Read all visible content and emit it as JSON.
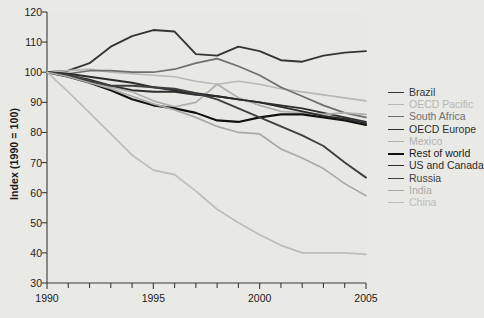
{
  "chart_data": {
    "type": "line",
    "title": "",
    "subtitle": "",
    "xlabel": "",
    "ylabel": "Index (1990 = 100)",
    "xlim": [
      1990,
      2005
    ],
    "ylim": [
      30,
      120
    ],
    "ytick_step": 10,
    "xtick_step": 5,
    "x_minor_tick_step": 1,
    "grid": false,
    "legend_position": "right",
    "background_color": "#e9e9e6",
    "plot_background_color": "#e8e8e5",
    "axis_color": "#3a3a3a",
    "x": [
      1990,
      1991,
      1992,
      1993,
      1994,
      1995,
      1996,
      1997,
      1998,
      1999,
      2000,
      2001,
      2002,
      2003,
      2004,
      2005
    ],
    "ytick_labels": [
      "120",
      "110",
      "100",
      "90",
      "80",
      "70",
      "60",
      "50",
      "40",
      "30"
    ],
    "xtick_labels": [
      "1990",
      "1995",
      "2000",
      "2005"
    ],
    "series": [
      {
        "name": "Brazil",
        "color": "#353535",
        "width": 1.9,
        "values": [
          100,
          100.5,
          103,
          108.5,
          112,
          114,
          113.5,
          106,
          105.5,
          108.5,
          107,
          104,
          103.5,
          105.5,
          106.5,
          107
        ]
      },
      {
        "name": "OECD Pacific",
        "color": "#b8b8b6",
        "width": 1.7,
        "values": [
          100,
          100.5,
          101,
          100,
          99.5,
          99,
          98.5,
          97,
          96,
          97,
          96,
          94.5,
          93.5,
          92.5,
          91.5,
          90.5
        ]
      },
      {
        "name": "South Africa",
        "color": "#6f6f6f",
        "width": 1.7,
        "values": [
          100,
          99.5,
          100.5,
          100.5,
          100,
          100,
          101,
          103,
          104.5,
          102,
          99,
          95,
          92,
          89,
          86.5,
          85
        ]
      },
      {
        "name": "OECD Europe",
        "color": "#2e2e2e",
        "width": 1.9,
        "values": [
          100,
          99,
          97.5,
          95.5,
          94,
          93.5,
          93.5,
          92.5,
          92,
          91,
          90,
          89,
          88,
          86.5,
          85,
          83.5
        ]
      },
      {
        "name": "Mexico",
        "color": "#b0b0ae",
        "width": 1.7,
        "values": [
          100,
          99,
          97,
          95,
          93.5,
          90.5,
          88.5,
          90,
          96,
          91.5,
          89,
          87,
          86.5,
          86,
          86.5,
          86
        ]
      },
      {
        "name": "Rest of world",
        "color": "#111111",
        "width": 2.1,
        "values": [
          100,
          98.5,
          96.5,
          94,
          91,
          89,
          88,
          86.5,
          84,
          83.5,
          85,
          86,
          86,
          85,
          84,
          82.5
        ]
      },
      {
        "name": "US and Canada",
        "color": "#2b2b2b",
        "width": 1.9,
        "values": [
          100,
          99.5,
          98.5,
          97.5,
          96.5,
          95,
          94,
          93,
          92,
          91,
          90,
          88.5,
          87,
          85.5,
          84.5,
          83
        ]
      },
      {
        "name": "Russia",
        "color": "#3f3f3f",
        "width": 1.9,
        "values": [
          100,
          99,
          97,
          95.5,
          95.5,
          95,
          94.5,
          93,
          91,
          88,
          85,
          82,
          79,
          75.5,
          70,
          65
        ]
      },
      {
        "name": "India",
        "color": "#a9a9a7",
        "width": 1.7,
        "values": [
          100,
          98.5,
          96.5,
          94.5,
          92,
          89.5,
          87.5,
          85,
          82,
          80,
          79.5,
          74.5,
          71.5,
          68,
          63,
          59
        ]
      },
      {
        "name": "China",
        "color": "#bdbdba",
        "width": 1.7,
        "values": [
          100,
          93.5,
          86.5,
          79.5,
          72.5,
          67.5,
          66,
          60.5,
          54.5,
          50,
          46,
          42.5,
          40,
          40,
          40,
          39.5
        ]
      }
    ]
  },
  "legend": {
    "items": [
      {
        "label": "Brazil"
      },
      {
        "label": "OECD Pacific"
      },
      {
        "label": "South Africa"
      },
      {
        "label": "OECD Europe"
      },
      {
        "label": "Mexico"
      },
      {
        "label": "Rest of world"
      },
      {
        "label": "US and Canada"
      },
      {
        "label": "Russia"
      },
      {
        "label": "India"
      },
      {
        "label": "China"
      }
    ]
  }
}
